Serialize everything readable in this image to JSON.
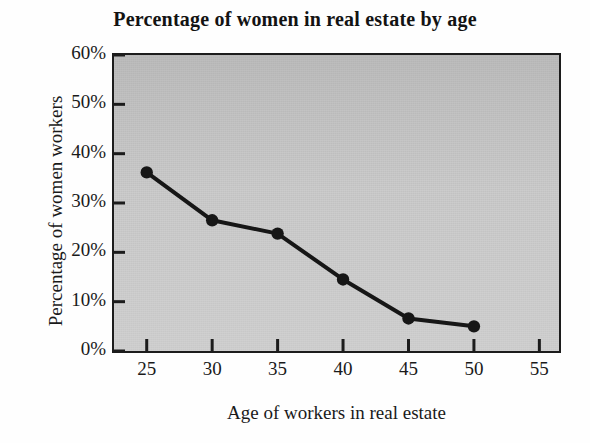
{
  "chart_data": {
    "type": "line",
    "title": "Percentage of women in real estate by age",
    "xlabel": "Age of workers in real estate",
    "ylabel": "Percentage of women workers",
    "x": [
      25,
      30,
      35,
      40,
      45,
      50
    ],
    "values": [
      36.2,
      26.5,
      23.8,
      14.5,
      6.6,
      5.0
    ],
    "series": [
      {
        "name": "Percentage of women workers",
        "values": [
          36.2,
          26.5,
          23.8,
          14.5,
          6.6,
          5.0
        ]
      }
    ],
    "xlim": [
      22.5,
      56.5
    ],
    "ylim": [
      0,
      60
    ],
    "xticks": [
      25,
      30,
      35,
      40,
      45,
      50,
      55
    ],
    "xtick_labels": [
      "25",
      "30",
      "35",
      "40",
      "45",
      "50",
      "55"
    ],
    "yticks": [
      0,
      10,
      20,
      30,
      40,
      50,
      60
    ],
    "ytick_labels": [
      "0%",
      "10%",
      "20%",
      "30%",
      "40%",
      "50%",
      "60%"
    ],
    "grid": false,
    "legend": null,
    "marker": "circle",
    "line_color": "#161616",
    "marker_color": "#161616",
    "plot_background": "#c9c9c9",
    "figure_background": "#fefefe",
    "axis_color": "#1c1c1c"
  }
}
